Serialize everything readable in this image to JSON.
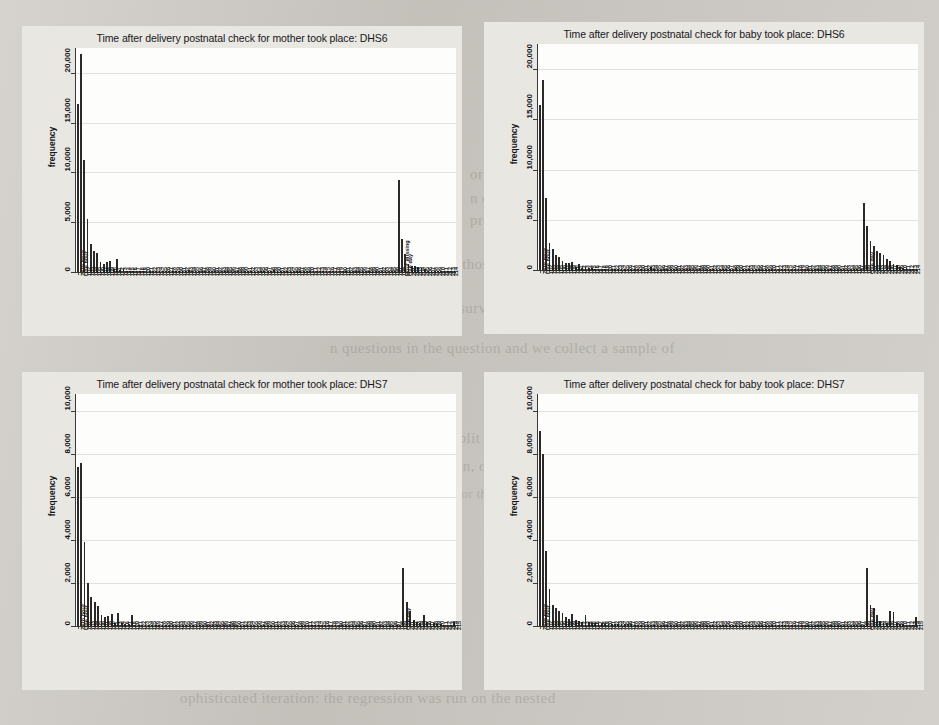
{
  "page": {
    "background_color": "#cecbc5",
    "panel_color": "#e9e7e2",
    "plot_color": "#fdfdfc",
    "bar_color": "#2b2a28"
  },
  "bleed_through_text": [
    {
      "text": "meas",
      "x": 640,
      "y": 96,
      "size": "big"
    },
    {
      "text": "ntc",
      "x": 640,
      "y": 128,
      "size": "big"
    },
    {
      "text": "or one of the key domair",
      "x": 470,
      "y": 166,
      "size": "med"
    },
    {
      "text": "n of the DHS. Either questions expl",
      "x": 470,
      "y": 190,
      "size": "med"
    },
    {
      "text": "pregnancies earlier, or respondent's levels is separately",
      "x": 470,
      "y": 212,
      "size": "med"
    },
    {
      "text": "sample compared to those who have been sampled for DHS7",
      "x": 330,
      "y": 256,
      "size": "med"
    },
    {
      "text": "eration based on the full survey, which is included within th",
      "x": 300,
      "y": 300,
      "size": "med"
    },
    {
      "text": "n questions in the question and we collect a sample of",
      "x": 330,
      "y": 340,
      "size": "med"
    },
    {
      "text": "we split out change in one",
      "x": 430,
      "y": 430,
      "size": "med"
    },
    {
      "text": "within, or that the survey",
      "x": 430,
      "y": 458,
      "size": "med"
    },
    {
      "text": "ame for the two, there is no",
      "x": 430,
      "y": 486,
      "size": "sm"
    },
    {
      "text": "ophisticated iteration: the regression was run on the nested",
      "x": 180,
      "y": 690,
      "size": "med"
    }
  ],
  "charts": [
    {
      "id": "mother-dhs6",
      "chart_data": {
        "type": "bar",
        "title": "Time after delivery postnatal check for mother took place: DHS6",
        "xlabel": "",
        "ylabel": "frequency",
        "ylim": [
          0,
          22500
        ],
        "yticks": [
          0,
          5000,
          10000,
          15000,
          20000
        ],
        "ytick_labels": [
          "0",
          "5,000",
          "10,000",
          "15,000",
          "20,000"
        ],
        "grid": true,
        "categories": [
          "Zero hour",
          "One hour",
          "102",
          "103",
          "104",
          "105",
          "106",
          "107",
          "108",
          "109",
          "110",
          "111",
          "112",
          "113",
          "114",
          "115",
          "116",
          "117",
          "118",
          "119",
          "120",
          "121",
          "122",
          "123",
          "124",
          "125",
          "126",
          "127",
          "128",
          "129",
          "130",
          "131",
          "132",
          "133",
          "134",
          "135",
          "136",
          "137",
          "138",
          "139",
          "140",
          "141",
          "142",
          "143",
          "144",
          "145",
          "146",
          "147",
          "148",
          "149",
          "150",
          "151",
          "152",
          "153",
          "154",
          "155",
          "156",
          "157",
          "158",
          "159",
          "160",
          "161",
          "162",
          "163",
          "164",
          "165",
          "166",
          "167",
          "168",
          "169",
          "170",
          "171",
          "172",
          "173",
          "174",
          "175",
          "176",
          "177",
          "178",
          "179",
          "180",
          "181",
          "182",
          "183",
          "184",
          "185",
          "186",
          "187",
          "188",
          "189",
          "190",
          "191",
          "192",
          "193",
          "194",
          "195",
          "196",
          "197",
          "198",
          "Hour missing",
          "One day",
          "201",
          "202",
          "203",
          "204",
          "205",
          "206",
          "207",
          "208",
          "209",
          "210",
          "211",
          "212",
          "213",
          "214",
          "215"
        ],
        "values": [
          16900,
          21900,
          11300,
          5300,
          2800,
          2100,
          1900,
          1050,
          800,
          1000,
          1150,
          320,
          1300,
          250,
          180,
          120,
          100,
          80,
          70,
          60,
          50,
          45,
          40,
          35,
          30,
          28,
          26,
          24,
          22,
          20,
          18,
          17,
          16,
          15,
          200,
          14,
          13,
          12,
          11,
          10,
          10,
          9,
          9,
          8,
          8,
          8,
          7,
          7,
          7,
          6,
          6,
          6,
          6,
          5,
          5,
          5,
          5,
          5,
          5,
          4,
          250,
          4,
          4,
          4,
          4,
          3,
          3,
          3,
          3,
          3,
          3,
          3,
          3,
          3,
          3,
          2,
          2,
          2,
          2,
          2,
          2,
          2,
          2,
          2,
          2,
          2,
          2,
          2,
          2,
          2,
          2,
          2,
          2,
          2,
          2,
          2,
          2,
          2,
          9200,
          3300,
          1800,
          800,
          650,
          600,
          500,
          420,
          340,
          120,
          90,
          70,
          60,
          50,
          40,
          35,
          30
        ]
      }
    },
    {
      "id": "baby-dhs6",
      "chart_data": {
        "type": "bar",
        "title": "Time after delivery postnatal check for baby took place: DHS6",
        "xlabel": "",
        "ylabel": "frequency",
        "ylim": [
          0,
          22500
        ],
        "yticks": [
          0,
          5000,
          10000,
          15000,
          20000
        ],
        "ytick_labels": [
          "0",
          "5,000",
          "10,000",
          "15,000",
          "20,000"
        ],
        "grid": true,
        "categories": [
          "Zero hour",
          "One hour",
          "102",
          "103",
          "104",
          "105",
          "106",
          "107",
          "108",
          "109",
          "110",
          "111",
          "112",
          "113",
          "114",
          "115",
          "116",
          "117",
          "118",
          "119",
          "120",
          "121",
          "122",
          "123",
          "124",
          "125",
          "126",
          "127",
          "128",
          "129",
          "130",
          "131",
          "132",
          "133",
          "134",
          "135",
          "136",
          "137",
          "138",
          "139",
          "140",
          "141",
          "142",
          "143",
          "144",
          "145",
          "146",
          "147",
          "148",
          "149",
          "150",
          "151",
          "152",
          "153",
          "154",
          "155",
          "156",
          "157",
          "158",
          "159",
          "160",
          "161",
          "162",
          "163",
          "164",
          "165",
          "166",
          "167",
          "168",
          "169",
          "170",
          "171",
          "172",
          "173",
          "174",
          "175",
          "176",
          "177",
          "178",
          "179",
          "180",
          "181",
          "182",
          "183",
          "184",
          "185",
          "186",
          "187",
          "188",
          "189",
          "190",
          "191",
          "192",
          "193",
          "194",
          "195",
          "196",
          "197",
          "198",
          "199",
          "One day",
          "201",
          "202",
          "203",
          "204",
          "205",
          "206",
          "207",
          "208",
          "209",
          "210",
          "211",
          "212",
          "213",
          "214",
          "215"
        ],
        "values": [
          16400,
          18900,
          7200,
          2700,
          2100,
          1500,
          1250,
          900,
          700,
          650,
          800,
          300,
          600,
          250,
          200,
          180,
          160,
          140,
          130,
          120,
          110,
          100,
          90,
          85,
          80,
          75,
          70,
          65,
          60,
          58,
          55,
          52,
          50,
          48,
          300,
          45,
          42,
          40,
          38,
          36,
          34,
          32,
          30,
          28,
          26,
          24,
          22,
          21,
          20,
          19,
          18,
          17,
          16,
          15,
          14,
          13,
          12,
          12,
          11,
          11,
          250,
          10,
          10,
          9,
          9,
          9,
          8,
          8,
          8,
          7,
          7,
          7,
          7,
          6,
          6,
          6,
          6,
          5,
          5,
          5,
          5,
          5,
          4,
          4,
          4,
          4,
          4,
          4,
          3,
          3,
          3,
          3,
          3,
          3,
          3,
          3,
          3,
          3,
          3,
          6700,
          4400,
          2900,
          2400,
          1900,
          1700,
          1500,
          1100,
          900,
          600,
          520,
          300,
          200,
          170,
          110,
          80
        ]
      }
    },
    {
      "id": "mother-dhs7",
      "chart_data": {
        "type": "bar",
        "title": "Time after delivery postnatal check for mother took place: DHS7",
        "xlabel": "",
        "ylabel": "frequency",
        "ylim": [
          0,
          10800
        ],
        "yticks": [
          0,
          2000,
          4000,
          6000,
          8000,
          10000
        ],
        "ytick_labels": [
          "0",
          "2,000",
          "4,000",
          "6,000",
          "8,000",
          "10,000"
        ],
        "grid": true,
        "categories": [
          "Zero hour",
          "One hour",
          "102",
          "103",
          "104",
          "105",
          "106",
          "107",
          "108",
          "110",
          "111",
          "113",
          "114",
          "116",
          "117",
          "118",
          "120",
          "121",
          "122",
          "123",
          "124",
          "125",
          "126",
          "127",
          "128",
          "129",
          "130",
          "131",
          "132",
          "133",
          "134",
          "135",
          "136",
          "137",
          "138",
          "139",
          "140",
          "141",
          "142",
          "143",
          "144",
          "145",
          "146",
          "147",
          "148",
          "149",
          "150",
          "151",
          "152",
          "153",
          "154",
          "155",
          "156",
          "157",
          "158",
          "159",
          "160",
          "161",
          "162",
          "163",
          "164",
          "165",
          "166",
          "167",
          "168",
          "169",
          "170",
          "171",
          "172",
          "173",
          "174",
          "175",
          "176",
          "177",
          "178",
          "179",
          "180",
          "181",
          "182",
          "183",
          "184",
          "185",
          "186",
          "187",
          "188",
          "189",
          "190",
          "191",
          "192",
          "193",
          "194",
          "195",
          "196",
          "197",
          "198",
          "199",
          "One day",
          "201",
          "202",
          "203",
          "204",
          "205",
          "206",
          "207",
          "208",
          "209",
          "210",
          "211",
          "212",
          "213",
          "214",
          "215"
        ],
        "values": [
          7400,
          7600,
          3900,
          2000,
          1350,
          1100,
          950,
          520,
          400,
          480,
          560,
          160,
          600,
          130,
          110,
          90,
          520,
          70,
          60,
          55,
          50,
          48,
          45,
          42,
          40,
          38,
          36,
          34,
          32,
          30,
          28,
          26,
          24,
          22,
          21,
          20,
          19,
          18,
          17,
          16,
          15,
          15,
          14,
          14,
          13,
          13,
          12,
          12,
          11,
          11,
          10,
          10,
          10,
          9,
          9,
          9,
          8,
          8,
          8,
          8,
          7,
          7,
          7,
          7,
          6,
          6,
          6,
          6,
          6,
          5,
          5,
          5,
          5,
          5,
          5,
          4,
          4,
          4,
          4,
          4,
          4,
          4,
          3,
          3,
          3,
          3,
          3,
          3,
          3,
          3,
          3,
          3,
          3,
          3,
          3,
          3,
          2700,
          1100,
          700,
          260,
          180,
          150,
          520,
          180,
          150,
          120,
          100,
          80,
          70,
          60,
          50,
          200
        ]
      }
    },
    {
      "id": "baby-dhs7",
      "chart_data": {
        "type": "bar",
        "title": "Time after delivery postnatal check for baby took place: DHS7",
        "xlabel": "",
        "ylabel": "frequency",
        "ylim": [
          0,
          10800
        ],
        "yticks": [
          0,
          2000,
          4000,
          6000,
          8000,
          10000
        ],
        "ytick_labels": [
          "0",
          "2,000",
          "4,000",
          "6,000",
          "8,000",
          "10,000"
        ],
        "grid": true,
        "categories": [
          "Zero hour",
          "One hour",
          "102",
          "103",
          "104",
          "105",
          "106",
          "107",
          "108",
          "109",
          "110",
          "111",
          "112",
          "113",
          "114",
          "115",
          "116",
          "117",
          "118",
          "119",
          "120",
          "121",
          "122",
          "123",
          "124",
          "125",
          "126",
          "127",
          "128",
          "129",
          "130",
          "131",
          "132",
          "133",
          "134",
          "135",
          "136",
          "137",
          "138",
          "139",
          "140",
          "141",
          "142",
          "143",
          "144",
          "145",
          "146",
          "147",
          "148",
          "149",
          "150",
          "151",
          "152",
          "153",
          "154",
          "155",
          "156",
          "157",
          "158",
          "159",
          "160",
          "161",
          "162",
          "163",
          "164",
          "165",
          "166",
          "167",
          "168",
          "169",
          "170",
          "171",
          "172",
          "173",
          "174",
          "175",
          "176",
          "177",
          "178",
          "179",
          "180",
          "181",
          "182",
          "183",
          "184",
          "185",
          "186",
          "187",
          "188",
          "189",
          "190",
          "191",
          "192",
          "193",
          "194",
          "195",
          "196",
          "197",
          "198",
          "199",
          "One day",
          "201",
          "202",
          "203",
          "204",
          "205",
          "206",
          "207",
          "208",
          "209",
          "210",
          "211",
          "212",
          "213",
          "214",
          "215"
        ],
        "values": [
          9100,
          8000,
          3500,
          1700,
          1000,
          820,
          700,
          620,
          420,
          330,
          560,
          280,
          240,
          200,
          520,
          170,
          150,
          140,
          130,
          120,
          110,
          100,
          95,
          90,
          85,
          80,
          78,
          75,
          72,
          70,
          68,
          65,
          62,
          60,
          58,
          55,
          52,
          50,
          48,
          46,
          44,
          42,
          40,
          38,
          36,
          34,
          32,
          30,
          29,
          28,
          27,
          26,
          25,
          24,
          23,
          22,
          21,
          20,
          19,
          18,
          18,
          17,
          17,
          16,
          16,
          15,
          15,
          14,
          14,
          13,
          13,
          12,
          12,
          11,
          11,
          10,
          10,
          10,
          9,
          9,
          9,
          8,
          8,
          8,
          7,
          7,
          7,
          7,
          6,
          6,
          6,
          6,
          5,
          5,
          5,
          5,
          5,
          4,
          4,
          4,
          2700,
          1000,
          850,
          500,
          220,
          160,
          140,
          700,
          650,
          130,
          90,
          80,
          70,
          60,
          50,
          420
        ]
      }
    }
  ]
}
